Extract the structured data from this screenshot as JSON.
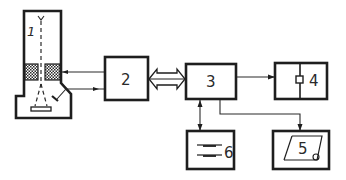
{
  "diagram": {
    "type": "block-diagram",
    "colors": {
      "line": "#1e1e1e",
      "background": "#ffffff"
    },
    "blocks": [
      {
        "id": "1",
        "label": "1",
        "shape": "column-with-base",
        "icons": [
          "electron-gun-icon",
          "coil-icon",
          "detector-icon",
          "sample-stage-icon"
        ]
      },
      {
        "id": "2",
        "label": "2",
        "shape": "rectangle"
      },
      {
        "id": "3",
        "label": "3",
        "shape": "rectangle"
      },
      {
        "id": "4",
        "label": "4",
        "shape": "rectangle-split",
        "icons": [
          "switch-icon"
        ]
      },
      {
        "id": "5",
        "label": "5",
        "shape": "rectangle",
        "icons": [
          "parallelogram-display-icon"
        ]
      },
      {
        "id": "6",
        "label": "6",
        "shape": "rectangle",
        "icons": [
          "storage-lines-icon"
        ]
      }
    ],
    "connections": [
      {
        "from": "2",
        "to": "1",
        "kind": "arrow",
        "target": "coil"
      },
      {
        "from": "1",
        "to": "2",
        "kind": "arrow",
        "source": "detector"
      },
      {
        "from": "2",
        "to": "3",
        "kind": "double-bus-arrow"
      },
      {
        "from": "3",
        "to": "4",
        "kind": "arrow"
      },
      {
        "from": "3",
        "to": "6",
        "kind": "bidirectional-arrow"
      },
      {
        "from": "3",
        "to": "5",
        "kind": "arrow"
      }
    ]
  }
}
